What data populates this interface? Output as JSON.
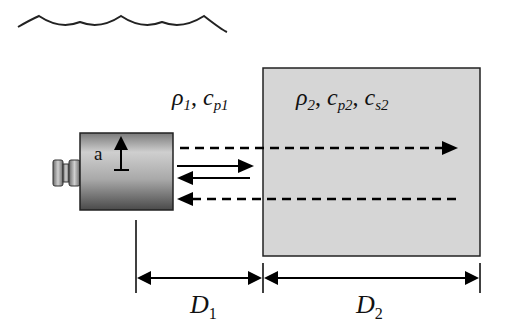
{
  "diagram": {
    "water_surface": "wavy-line",
    "medium1": {
      "label_rho": "ρ",
      "label_rho_sub": "1",
      "label_c": "c",
      "label_c_sub": "p1"
    },
    "medium2": {
      "label_rho": "ρ",
      "label_rho_sub": "2",
      "label_cp": "c",
      "label_cp_sub": "p2",
      "label_cs": "c",
      "label_cs_sub": "s2",
      "fill": "#d6d6d6"
    },
    "transducer": {
      "aperture_label": "a",
      "body_gradient": [
        "#e8e8e8",
        "#555555"
      ]
    },
    "dimensions": [
      {
        "label": "D",
        "sub": "1"
      },
      {
        "label": "D",
        "sub": "2"
      }
    ],
    "separator": ","
  }
}
